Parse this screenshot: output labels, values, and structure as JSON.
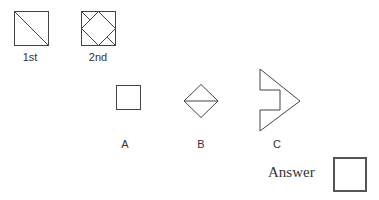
{
  "figures": {
    "first": {
      "label": "1st"
    },
    "second": {
      "label": "2nd"
    }
  },
  "options": [
    {
      "label": "A",
      "shape": "small square"
    },
    {
      "label": "B",
      "shape": "diamond with horizontal diagonal"
    },
    {
      "label": "C",
      "shape": "arrow-like polygon with notch"
    }
  ],
  "answer": {
    "label": "Answer",
    "value": ""
  },
  "colors": {
    "stroke": "#444444",
    "answer_border": "#555555"
  }
}
